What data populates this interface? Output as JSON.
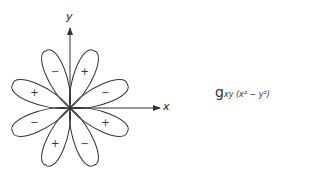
{
  "axes": {
    "x_label": "x",
    "y_label": "y"
  },
  "lobes": [
    {
      "angle": -67.5,
      "sign": "−"
    },
    {
      "angle": -22.5,
      "sign": "+"
    },
    {
      "angle": 22.5,
      "sign": "−"
    },
    {
      "angle": 67.5,
      "sign": "+"
    },
    {
      "angle": 112.5,
      "sign": "−"
    },
    {
      "angle": 157.5,
      "sign": "+"
    },
    {
      "angle": 202.5,
      "sign": "−"
    },
    {
      "angle": 247.5,
      "sign": "+"
    }
  ],
  "equation": {
    "main": "g",
    "subscript": "xy (x² − y²)"
  },
  "colors": {
    "stroke": "#333333"
  }
}
